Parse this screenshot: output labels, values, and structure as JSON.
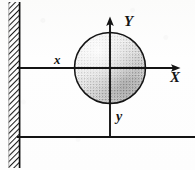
{
  "figure": {
    "kind": "physics-diagram",
    "background_color": "#fdfdfc",
    "ink_color": "#151515"
  },
  "labels": {
    "axis_Y_upper": "Y",
    "axis_X_upper": "X",
    "axis_x_lower": "x",
    "axis_y_lower": "y"
  },
  "elements": {
    "wall": {
      "name": "hatched-wall",
      "x": 8,
      "y": 2,
      "width": 12,
      "height": 166,
      "hatch_angle_deg": 45
    },
    "sphere": {
      "name": "shaded-sphere",
      "center_x": 110,
      "center_y": 68,
      "radius": 36,
      "fill": "stipple",
      "shading": "darker toward lower-right"
    },
    "axis_horizontal_upper": {
      "name": "x-axis-line",
      "x1": 17,
      "y1": 68,
      "x2": 181,
      "y2": 68,
      "arrow": "right-end"
    },
    "axis_vertical": {
      "name": "y-axis-line",
      "x1": 110,
      "y1": 17,
      "x2": 110,
      "y2": 138,
      "arrow": "top-end"
    },
    "ground_line": {
      "name": "ground-line",
      "x1": 17,
      "y1": 137,
      "x2": 195,
      "y2": 137
    }
  }
}
